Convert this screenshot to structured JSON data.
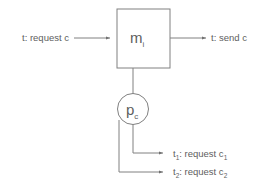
{
  "diagram": {
    "nodes": {
      "module": {
        "shape": "rectangle",
        "base": "m",
        "subscript": "i"
      },
      "port": {
        "shape": "circle",
        "base": "p",
        "subscript": "c"
      }
    },
    "labels": {
      "input": "t: request c",
      "output": "t: send c",
      "branch_1_prefix": "t",
      "branch_1_sub1": "1",
      "branch_1_mid": ": request c",
      "branch_1_sub2": "1",
      "branch_2_prefix": "t",
      "branch_2_sub1": "2",
      "branch_2_mid": ": request c",
      "branch_2_sub2": "2"
    },
    "colors": {
      "stroke": "#808080",
      "text": "#5e5e5e",
      "background": "#ffffff"
    }
  }
}
